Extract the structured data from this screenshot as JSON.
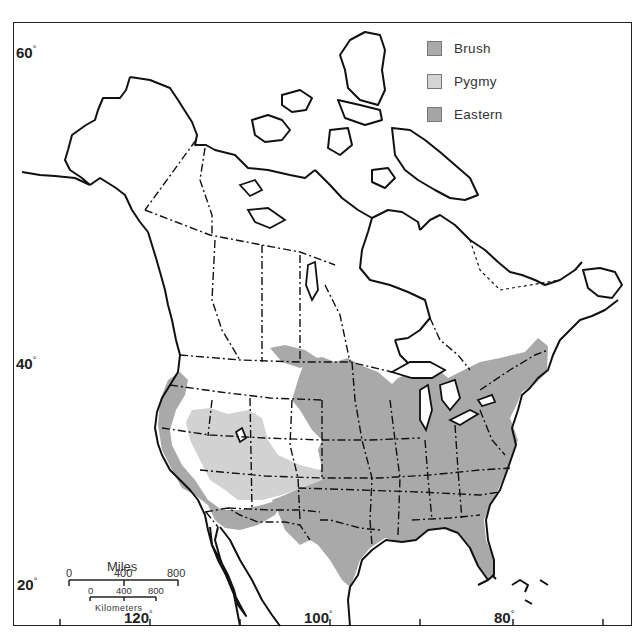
{
  "map": {
    "latitude_labels": [
      {
        "value": "60",
        "unit": "°"
      },
      {
        "value": "40",
        "unit": "°"
      },
      {
        "value": "20",
        "unit": "°"
      }
    ],
    "longitude_labels": [
      {
        "value": "120",
        "unit": "°"
      },
      {
        "value": "100",
        "unit": "°"
      },
      {
        "value": "80",
        "unit": "°"
      }
    ],
    "colors": {
      "brush": "#a9a9a9",
      "pygmy": "#d2d2d2",
      "eastern": "#a9a9a9",
      "outline": "#111111"
    }
  },
  "legend": {
    "items": [
      {
        "label": "Brush",
        "color": "#aaaaaa"
      },
      {
        "label": "Pygmy",
        "color": "#d4d4d4"
      },
      {
        "label": "Eastern",
        "color": "#a6a6a6"
      }
    ]
  },
  "scale_bar": {
    "miles_title": "Miles",
    "miles_ticks": [
      "0",
      "400",
      "800"
    ],
    "km_ticks": [
      "0",
      "400",
      "800"
    ],
    "km_title": "Kilometers"
  }
}
